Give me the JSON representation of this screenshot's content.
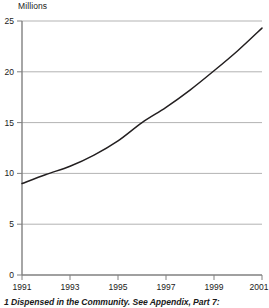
{
  "chart_data": {
    "type": "line",
    "title": "",
    "subtitle": "",
    "xlabel": "",
    "ylabel": "Millions",
    "unit_label": "Millions",
    "x": [
      1991,
      1992,
      1993,
      1994,
      1995,
      1996,
      1997,
      1998,
      1999,
      2000,
      2001
    ],
    "values": [
      9.0,
      9.9,
      10.7,
      11.8,
      13.2,
      15.0,
      16.5,
      18.2,
      20.1,
      22.1,
      24.3
    ],
    "series": [
      {
        "name": "Prescription items",
        "values": [
          9.0,
          9.9,
          10.7,
          11.8,
          13.2,
          15.0,
          16.5,
          18.2,
          20.1,
          22.1,
          24.3
        ]
      }
    ],
    "xlim": [
      1991,
      2001
    ],
    "ylim": [
      0,
      25
    ],
    "yticks": [
      0,
      5,
      10,
      15,
      20,
      25
    ],
    "ytick_labels": [
      "0",
      "5",
      "10",
      "15",
      "20",
      "25"
    ],
    "xticks": [
      1991,
      1993,
      1995,
      1997,
      1999,
      2001
    ],
    "xtick_labels": [
      "1991",
      "1993",
      "1995",
      "1997",
      "1999",
      "2001"
    ],
    "grid": "horizontal",
    "legend": "none",
    "line_color": "#231f20",
    "grid_color": "#b3b3b3",
    "axis_color": "#808080"
  },
  "footnote": {
    "text": "1 Dispensed in the Community. See Appendix, Part 7:"
  }
}
